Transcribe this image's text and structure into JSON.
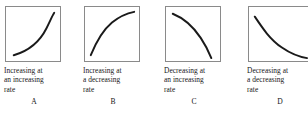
{
  "figure": {
    "background_color": "#ffffff",
    "ink_color": "#171717",
    "box_border_color": "#8a8a8a",
    "curve_color": "#1a1a1a"
  },
  "panels": [
    {
      "letter": "A",
      "caption": "Increasing at\nan increasing\nrate",
      "caption_line1": "Increasing at",
      "caption_line2": "an increasing",
      "caption_line3": "rate",
      "curve_name": "convex-increasing-curve",
      "direction": "increasing",
      "concavity": "increasing rate",
      "curve_path": "M 8 50 C 22 46, 34 38, 42 22 C 46 14, 48 9, 50 6"
    },
    {
      "letter": "B",
      "caption": "Increasing at\na decreasing\nrate",
      "caption_line1": "Increasing at",
      "caption_line2": "a decreasing",
      "caption_line3": "rate",
      "curve_name": "concave-increasing-curve",
      "direction": "increasing",
      "concavity": "decreasing rate",
      "curve_path": "M 6 50 C 10 40, 16 26, 28 16 C 38 8, 46 6, 51 5"
    },
    {
      "letter": "C",
      "caption": "Decreasing at\nan increasing\nrate",
      "caption_line1": "Decreasing at",
      "caption_line2": "an increasing",
      "caption_line3": "rate",
      "curve_name": "concave-decreasing-curve",
      "direction": "decreasing",
      "concavity": "increasing rate",
      "curve_path": "M 7 7 C 17 11, 28 20, 36 32 C 42 41, 45 48, 47 53"
    },
    {
      "letter": "D",
      "caption": "Decreasing at\na decreasing\nrate",
      "caption_line1": "Decreasing at",
      "caption_line2": "a decreasing",
      "caption_line3": "rate",
      "curve_name": "convex-decreasing-curve",
      "direction": "decreasing",
      "concavity": "decreasing rate",
      "curve_path": "M 6 10 C 14 22, 22 34, 34 42 C 44 49, 54 52, 60 53"
    }
  ]
}
